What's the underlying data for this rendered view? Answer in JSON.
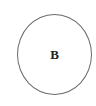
{
  "diagram": {
    "nodes": [
      {
        "id": "B",
        "label": "B",
        "shape": "ellipse",
        "stroke": "#6b6b6b",
        "fill": "#ffffff"
      }
    ],
    "edges": []
  }
}
